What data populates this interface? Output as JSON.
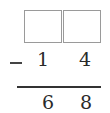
{
  "problem": {
    "type": "vertical-subtraction",
    "operator": "−",
    "minuend_boxes": [
      "",
      ""
    ],
    "subtrahend": [
      "1",
      "4"
    ],
    "difference": [
      "6",
      "8"
    ]
  }
}
